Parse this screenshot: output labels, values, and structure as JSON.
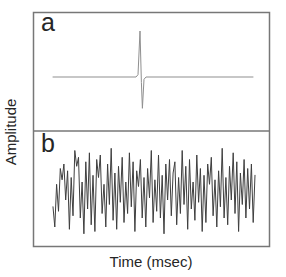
{
  "figure": {
    "panels": [
      {
        "label": "a"
      },
      {
        "label": "b"
      }
    ],
    "y_axis_label": "Amplitude",
    "x_axis_label": "Time (msec)"
  },
  "colors": {
    "background": "#ffffff",
    "frame": "#777777",
    "impulse_trace": "#8f8f8f",
    "noise_trace": "#3f3f3f",
    "text": "#262626"
  },
  "chart_data": [
    {
      "type": "line",
      "panel_label": "a",
      "xlabel": "Time (msec)",
      "ylabel": "Amplitude",
      "x_axis_ticks": [],
      "y_axis_ticks": [],
      "ylim": [
        -1,
        1
      ],
      "grid": false,
      "legend": false,
      "points_xfrac_value": [
        [
          0,
          0
        ],
        [
          0.415,
          0
        ],
        [
          0.425,
          0.05
        ],
        [
          0.435,
          1.0
        ],
        [
          0.442,
          -0.12
        ],
        [
          0.447,
          -0.68
        ],
        [
          0.455,
          -0.05
        ],
        [
          0.465,
          0
        ],
        [
          1,
          0
        ]
      ]
    },
    {
      "type": "line",
      "panel_label": "b",
      "xlabel": "Time (msec)",
      "ylabel": "Amplitude",
      "x_axis_ticks": [],
      "y_axis_ticks": [],
      "ylim": [
        -1,
        1
      ],
      "grid": false,
      "legend": false,
      "values": [
        -0.35,
        -0.8,
        0.15,
        -0.45,
        0.5,
        0.25,
        0.6,
        -0.2,
        0.45,
        -0.85,
        0.3,
        -0.55,
        0.9,
        0.55,
        0.75,
        -0.6,
        0.2,
        -0.95,
        0.65,
        -0.4,
        0.85,
        -0.75,
        0.35,
        -0.9,
        0.7,
        0.3,
        0.8,
        -0.5,
        0.15,
        -0.8,
        0.6,
        -0.3,
        0.95,
        -0.65,
        0.4,
        -0.85,
        0.55,
        -0.25,
        0.75,
        -0.7,
        0.2,
        -0.5,
        0.85,
        -0.35,
        0.65,
        -0.9,
        0.45,
        0.1,
        0.7,
        -0.6,
        0.3,
        -0.8,
        0.5,
        -0.15,
        0.9,
        -0.7,
        0.25,
        -0.45,
        0.8,
        -0.6,
        0.35,
        -0.95,
        0.6,
        -0.2,
        0.7,
        -0.55,
        0.4,
        0.65,
        -0.75,
        0.3,
        -0.5,
        0.9,
        -0.3,
        0.55,
        -0.85,
        0.7,
        -0.4,
        0.2,
        -0.65,
        0.8,
        -0.25,
        0.5,
        -0.9,
        0.35,
        -0.7,
        0.6,
        0.15,
        0.75,
        -0.55,
        0.25,
        -0.8,
        0.45,
        -0.35,
        0.95,
        -0.6,
        0.3,
        -0.75,
        0.55,
        -0.2,
        0.85,
        -0.5,
        0.65,
        -0.9,
        0.4,
        -0.3,
        0.7,
        -0.6,
        0.5,
        -0.4,
        0.6,
        -0.7,
        0.35
      ]
    }
  ]
}
